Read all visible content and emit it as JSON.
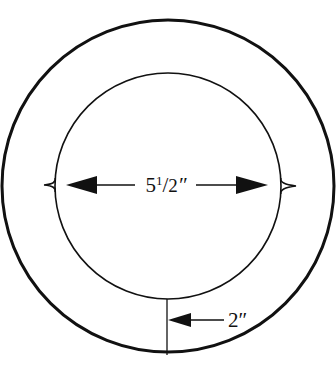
{
  "diagram": {
    "colors": {
      "stroke": "#111111",
      "background": "#ffffff"
    },
    "outer_circle": {
      "cx": 168,
      "cy": 186,
      "r": 166,
      "stroke_width": 3
    },
    "inner_circle": {
      "cx": 168,
      "cy": 186,
      "r": 113,
      "stroke_width": 1.6
    },
    "dimensions": {
      "inner_diameter": {
        "whole": "5",
        "frac_num": "1",
        "frac_den": "2",
        "unit": "″",
        "label": "5 1/2″"
      },
      "ring_width": {
        "label": "2″"
      }
    }
  }
}
